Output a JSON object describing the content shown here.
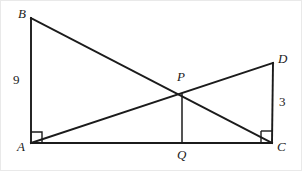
{
  "figure": {
    "width": 302,
    "height": 171,
    "background_color": "#ffffff",
    "stroke_color": "#1b1b1b",
    "points": {
      "A": {
        "label": "A",
        "x": 31,
        "y": 143
      },
      "B": {
        "label": "B",
        "x": 31,
        "y": 18
      },
      "C": {
        "label": "C",
        "x": 272,
        "y": 143
      },
      "D": {
        "label": "D",
        "x": 273,
        "y": 63
      },
      "P": {
        "label": "P",
        "x": 182,
        "y": 94
      },
      "Q": {
        "label": "Q",
        "x": 182,
        "y": 143
      }
    },
    "segments": [
      {
        "name": "segment-AB",
        "from": "A",
        "to": "B"
      },
      {
        "name": "segment-AC",
        "from": "A",
        "to": "C"
      },
      {
        "name": "segment-BC",
        "from": "B",
        "to": "C"
      },
      {
        "name": "segment-AD",
        "from": "A",
        "to": "D"
      },
      {
        "name": "segment-CD",
        "from": "C",
        "to": "D"
      },
      {
        "name": "segment-PQ",
        "from": "P",
        "to": "Q"
      }
    ],
    "length_labels": {
      "AB": "9",
      "CD": "3"
    },
    "right_angles": [
      {
        "name": "right-angle-at-A",
        "vertex": "A"
      },
      {
        "name": "right-angle-at-C",
        "vertex": "C"
      }
    ],
    "label_positions": {
      "B": {
        "x": 18,
        "y": 7
      },
      "A": {
        "x": 17,
        "y": 140
      },
      "D": {
        "x": 278,
        "y": 52
      },
      "C": {
        "x": 277,
        "y": 140
      },
      "P": {
        "x": 177,
        "y": 70
      },
      "Q": {
        "x": 177,
        "y": 148
      },
      "nine": {
        "x": 13,
        "y": 73
      },
      "three": {
        "x": 279,
        "y": 95
      }
    }
  }
}
